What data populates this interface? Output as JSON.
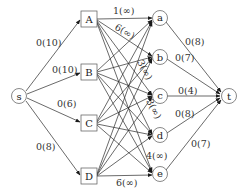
{
  "diagram": {
    "type": "flow-network",
    "source": {
      "id": "s",
      "label": "s"
    },
    "sink": {
      "id": "t",
      "label": "t"
    },
    "left_nodes": [
      {
        "id": "A",
        "label": "A"
      },
      {
        "id": "B",
        "label": "B"
      },
      {
        "id": "C",
        "label": "C"
      },
      {
        "id": "D",
        "label": "D"
      }
    ],
    "right_nodes": [
      {
        "id": "a",
        "label": "a"
      },
      {
        "id": "b",
        "label": "b"
      },
      {
        "id": "c",
        "label": "c"
      },
      {
        "id": "d",
        "label": "d"
      },
      {
        "id": "e",
        "label": "e"
      }
    ],
    "source_edges": [
      {
        "to": "A",
        "label": "0(10)"
      },
      {
        "to": "B",
        "label": "0(10)"
      },
      {
        "to": "C",
        "label": "0(6)"
      },
      {
        "to": "D",
        "label": "0(8)"
      }
    ],
    "sink_edges": [
      {
        "from": "a",
        "label": "0(8)"
      },
      {
        "from": "b",
        "label": "0(7)"
      },
      {
        "from": "c",
        "label": "0(4)"
      },
      {
        "from": "d",
        "label": "0(8)"
      },
      {
        "from": "e",
        "label": "0(7)"
      }
    ],
    "middle_edges_note": "complete bipartite: every left node connects to every right node",
    "middle_labels": [
      {
        "from": "A",
        "to": "a",
        "label": "1(∞)"
      },
      {
        "from": "A",
        "to": "b",
        "label": "6(∞)"
      },
      {
        "from": "B",
        "to": "c",
        "label": "3(∞)"
      },
      {
        "from": "C",
        "to": "d",
        "label": "3(∞)"
      },
      {
        "from": "D",
        "to": "e",
        "label": "6(∞)"
      },
      {
        "from": "?",
        "to": "e",
        "label": "4(∞)"
      }
    ]
  }
}
